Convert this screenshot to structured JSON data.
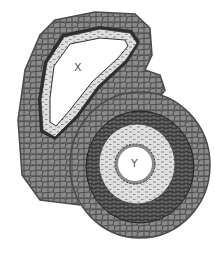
{
  "diagram": {
    "type": "cross-section illustration",
    "vessels": [
      {
        "id": "X",
        "label": "X",
        "shape": "irregular triangular, collapsed lumen",
        "wall": "thin pale wall with dashed inner layer",
        "label_pos": [
          78,
          68
        ]
      },
      {
        "id": "Y",
        "label": "Y",
        "shape": "round, small lumen",
        "wall": "thick wall with brick-patterned dark muscular layer and pale dashed inner layer; crenated inner lining",
        "label_pos": [
          135,
          165
        ]
      }
    ],
    "surrounding_tissue": "grey polygonal cells",
    "colors": {
      "cells": "#8a8a8a",
      "cell_border": "#4a4a4a",
      "dark_layer": "#3a3a3a",
      "pale_layer": "#dedede",
      "lumen": "#ffffff"
    }
  }
}
